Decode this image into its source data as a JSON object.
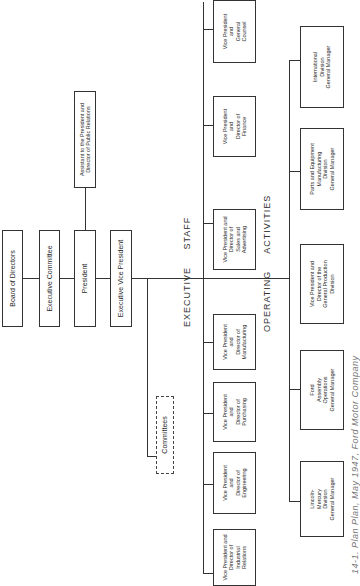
{
  "chart_title_caption": "14-1. Plan Plan, May 1947, Ford Motor Company",
  "top": {
    "board": "Board of Directors",
    "executive_committee": "Executive Committee",
    "president": "President",
    "assistant": "Assistant to the President and\nDirector of Public Relations",
    "executive_vp": "Executive Vice President",
    "committees": "Committees"
  },
  "sections": {
    "executive_staff": "EXECUTIVE     STAFF",
    "operating_activities": "OPERATING     ACTIVITIES"
  },
  "executive_staff": [
    "Vice President and\nDirector of\nIndustrial\nRelations",
    "Vice President\nand\nDirector of\nEngineering",
    "Vice President\nand\nDirector of\nPurchasing",
    "Vice President\nand\nDirector of\nManufacturing",
    "Vice President and\nDirector of\nSales and\nAdvertising",
    "Vice President\nand\nDirector of\nFinance",
    "Vice President\nand\nGeneral\nCounsel"
  ],
  "operating_activities": [
    "Lincoln-\nMercury\nDivision\nGeneral Manager",
    "Ford\nAssembly\nOperations\nGeneral Manager",
    "Vice President and\nDirector of the\nGeneral Production\nDivision",
    "Parts and Equipment\nManufacturing\nDivision\nGeneral Manager",
    "International\nDivision\nGeneral Manager"
  ]
}
